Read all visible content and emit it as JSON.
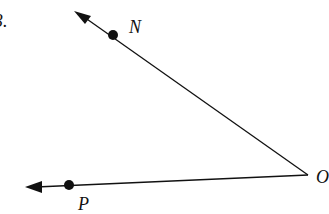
{
  "problem_number": "3.",
  "diagram": {
    "type": "angle",
    "vertex": {
      "label": "O",
      "x": 308,
      "y": 175
    },
    "rays": [
      {
        "name": "ray-ON",
        "point": {
          "label": "N",
          "x": 113,
          "y": 35
        },
        "arrow_tip": {
          "x": 74,
          "y": 11
        }
      },
      {
        "name": "ray-OP",
        "point": {
          "label": "P",
          "x": 69,
          "y": 185
        },
        "arrow_tip": {
          "x": 25,
          "y": 187
        }
      }
    ],
    "colors": {
      "line": "#111111",
      "background": "#ffffff"
    }
  }
}
